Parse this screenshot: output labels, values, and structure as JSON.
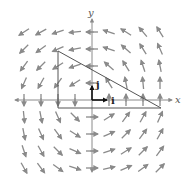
{
  "diagram": {
    "type": "vector-field",
    "axes": {
      "x_label": "x",
      "y_label": "y",
      "origin_px": [
        92,
        100
      ],
      "unit_px": 17
    },
    "unit_vectors": [
      {
        "name": "i",
        "label": "i",
        "from": [
          0,
          0
        ],
        "to": [
          1,
          0
        ]
      },
      {
        "name": "j",
        "label": "j",
        "from": [
          0,
          0
        ],
        "to": [
          0,
          1
        ]
      }
    ],
    "triangle": {
      "vertices": [
        [
          -2,
          2.9
        ],
        [
          -2,
          -0.5
        ],
        [
          4,
          -0.5
        ]
      ],
      "orientation_arrow_on_vertical_edge": "down"
    },
    "colors": {
      "arrow": "#8a8a8a",
      "axis": "#8a8a8a",
      "path": "#555555",
      "unit_vector": "#111111"
    },
    "arrows": [
      {
        "x": -4,
        "y": 4,
        "dx": -0.9,
        "dy": -0.6
      },
      {
        "x": -3,
        "y": 4,
        "dx": -0.9,
        "dy": -0.5
      },
      {
        "x": -2,
        "y": 4,
        "dx": -0.9,
        "dy": -0.3
      },
      {
        "x": -1,
        "y": 4,
        "dx": -1,
        "dy": -0.1
      },
      {
        "x": 0,
        "y": 4,
        "dx": -1,
        "dy": 0
      },
      {
        "x": 1,
        "y": 4,
        "dx": -0.9,
        "dy": 0.3
      },
      {
        "x": 2,
        "y": 4,
        "dx": -0.8,
        "dy": 0.5
      },
      {
        "x": 3,
        "y": 4,
        "dx": -0.6,
        "dy": 0.7
      },
      {
        "x": 4,
        "y": 4,
        "dx": -0.5,
        "dy": 0.8
      },
      {
        "x": -4,
        "y": 3,
        "dx": -0.7,
        "dy": -0.7
      },
      {
        "x": -3,
        "y": 3,
        "dx": -0.8,
        "dy": -0.6
      },
      {
        "x": -2,
        "y": 3,
        "dx": -0.9,
        "dy": -0.4
      },
      {
        "x": -1,
        "y": 3,
        "dx": -1,
        "dy": -0.2
      },
      {
        "x": 0,
        "y": 3,
        "dx": -1,
        "dy": 0
      },
      {
        "x": 1,
        "y": 3,
        "dx": -0.9,
        "dy": 0.3
      },
      {
        "x": 2,
        "y": 3,
        "dx": -0.7,
        "dy": 0.6
      },
      {
        "x": 3,
        "y": 3,
        "dx": -0.5,
        "dy": 0.8
      },
      {
        "x": 4,
        "y": 3,
        "dx": -0.4,
        "dy": 0.9
      },
      {
        "x": -4,
        "y": 2,
        "dx": -0.6,
        "dy": -0.8
      },
      {
        "x": -3,
        "y": 2,
        "dx": -0.7,
        "dy": -0.7
      },
      {
        "x": -2,
        "y": 2,
        "dx": -0.8,
        "dy": -0.5
      },
      {
        "x": -1,
        "y": 2,
        "dx": -0.9,
        "dy": -0.3
      },
      {
        "x": 0,
        "y": 2,
        "dx": -1,
        "dy": 0
      },
      {
        "x": 1,
        "y": 2,
        "dx": -0.7,
        "dy": 0.6
      },
      {
        "x": 2,
        "y": 2,
        "dx": -0.5,
        "dy": 0.8
      },
      {
        "x": 3,
        "y": 2,
        "dx": -0.3,
        "dy": 0.9
      },
      {
        "x": 4,
        "y": 2,
        "dx": -0.2,
        "dy": 1
      },
      {
        "x": -4,
        "y": 1,
        "dx": -0.4,
        "dy": -0.9
      },
      {
        "x": -3,
        "y": 1,
        "dx": -0.5,
        "dy": -0.9
      },
      {
        "x": -2,
        "y": 1,
        "dx": -0.6,
        "dy": -0.8
      },
      {
        "x": -1,
        "y": 1,
        "dx": -0.8,
        "dy": -0.5
      },
      {
        "x": 0,
        "y": 1,
        "dx": -1,
        "dy": 0
      },
      {
        "x": 1,
        "y": 1,
        "dx": -0.5,
        "dy": 0.8
      },
      {
        "x": 2,
        "y": 1,
        "dx": -0.2,
        "dy": 1
      },
      {
        "x": 3,
        "y": 1,
        "dx": -0.1,
        "dy": 1
      },
      {
        "x": 4,
        "y": 1,
        "dx": 0,
        "dy": 1
      },
      {
        "x": -4,
        "y": 0,
        "dx": 0,
        "dy": -1
      },
      {
        "x": -3,
        "y": 0,
        "dx": 0,
        "dy": -1
      },
      {
        "x": -2,
        "y": 0,
        "dx": 0,
        "dy": -1
      },
      {
        "x": -1,
        "y": 0,
        "dx": 0,
        "dy": -1
      },
      {
        "x": 1,
        "y": 0,
        "dx": 0,
        "dy": 1
      },
      {
        "x": 2,
        "y": 0,
        "dx": 0,
        "dy": 1
      },
      {
        "x": 3,
        "y": 0,
        "dx": 0,
        "dy": 1
      },
      {
        "x": 4,
        "y": 0,
        "dx": 0,
        "dy": 1
      },
      {
        "x": -4,
        "y": -1,
        "dx": 0.1,
        "dy": -1
      },
      {
        "x": -3,
        "y": -1,
        "dx": 0.2,
        "dy": -1
      },
      {
        "x": -2,
        "y": -1,
        "dx": 0.4,
        "dy": -0.9
      },
      {
        "x": -1,
        "y": -1,
        "dx": 0.7,
        "dy": -0.7
      },
      {
        "x": 0,
        "y": -1,
        "dx": 1,
        "dy": 0
      },
      {
        "x": 1,
        "y": -1,
        "dx": 0.8,
        "dy": 0.5
      },
      {
        "x": 2,
        "y": -1,
        "dx": 0.6,
        "dy": 0.8
      },
      {
        "x": 3,
        "y": -1,
        "dx": 0.5,
        "dy": 0.9
      },
      {
        "x": 4,
        "y": -1,
        "dx": 0.4,
        "dy": 0.9
      },
      {
        "x": -4,
        "y": -2,
        "dx": 0.2,
        "dy": -1
      },
      {
        "x": -3,
        "y": -2,
        "dx": 0.4,
        "dy": -0.9
      },
      {
        "x": -2,
        "y": -2,
        "dx": 0.6,
        "dy": -0.8
      },
      {
        "x": -1,
        "y": -2,
        "dx": 0.8,
        "dy": -0.5
      },
      {
        "x": 0,
        "y": -2,
        "dx": 1,
        "dy": 0
      },
      {
        "x": 1,
        "y": -2,
        "dx": 0.9,
        "dy": 0.4
      },
      {
        "x": 2,
        "y": -2,
        "dx": 0.7,
        "dy": 0.7
      },
      {
        "x": 3,
        "y": -2,
        "dx": 0.6,
        "dy": 0.8
      },
      {
        "x": 4,
        "y": -2,
        "dx": 0.5,
        "dy": 0.9
      },
      {
        "x": -4,
        "y": -3,
        "dx": 0.3,
        "dy": -0.9
      },
      {
        "x": -3,
        "y": -3,
        "dx": 0.5,
        "dy": -0.9
      },
      {
        "x": -2,
        "y": -3,
        "dx": 0.7,
        "dy": -0.7
      },
      {
        "x": -1,
        "y": -3,
        "dx": 0.9,
        "dy": -0.4
      },
      {
        "x": 0,
        "y": -3,
        "dx": 1,
        "dy": 0
      },
      {
        "x": 1,
        "y": -3,
        "dx": 0.9,
        "dy": 0.3
      },
      {
        "x": 2,
        "y": -3,
        "dx": 0.8,
        "dy": 0.5
      },
      {
        "x": 3,
        "y": -3,
        "dx": 0.7,
        "dy": 0.7
      },
      {
        "x": 4,
        "y": -3,
        "dx": 0.6,
        "dy": 0.8
      },
      {
        "x": -4,
        "y": -4,
        "dx": 0.5,
        "dy": -0.9
      },
      {
        "x": -3,
        "y": -4,
        "dx": 0.6,
        "dy": -0.8
      },
      {
        "x": -2,
        "y": -4,
        "dx": 0.8,
        "dy": -0.6
      },
      {
        "x": -1,
        "y": -4,
        "dx": 0.9,
        "dy": -0.3
      },
      {
        "x": 0,
        "y": -4,
        "dx": 1,
        "dy": 0
      },
      {
        "x": 1,
        "y": -4,
        "dx": 0.9,
        "dy": 0.2
      },
      {
        "x": 2,
        "y": -4,
        "dx": 0.9,
        "dy": 0.4
      },
      {
        "x": 3,
        "y": -4,
        "dx": 0.8,
        "dy": 0.6
      },
      {
        "x": 4,
        "y": -4,
        "dx": 0.7,
        "dy": 0.7
      }
    ]
  }
}
